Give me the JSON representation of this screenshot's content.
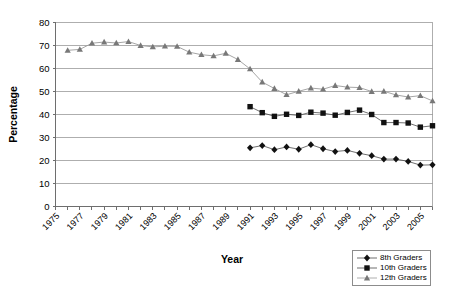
{
  "chart_data": {
    "type": "line",
    "title": "",
    "xlabel": "Year",
    "ylabel": "Percentage",
    "xlim": [
      1975,
      2006
    ],
    "ylim": [
      0,
      80
    ],
    "ytick_step": 10,
    "grid": true,
    "legend_position": "bottom-right",
    "yticks": [
      0,
      10,
      20,
      30,
      40,
      50,
      60,
      70,
      80
    ],
    "xticks": [
      1975,
      1976,
      1977,
      1978,
      1979,
      1980,
      1981,
      1982,
      1983,
      1984,
      1985,
      1986,
      1987,
      1988,
      1989,
      1990,
      1991,
      1992,
      1993,
      1994,
      1995,
      1996,
      1997,
      1998,
      1999,
      2000,
      2001,
      2002,
      2003,
      2004,
      2005,
      2006
    ],
    "xtick_labels": [
      "1975",
      "",
      "1977",
      "",
      "1979",
      "",
      "1981",
      "",
      "1983",
      "",
      "1985",
      "",
      "1987",
      "",
      "1989",
      "",
      "1991",
      "",
      "1993",
      "",
      "1995",
      "",
      "1997",
      "",
      "1999",
      "",
      "2001",
      "",
      "2003",
      "",
      "2005",
      ""
    ],
    "series": [
      {
        "name": "8th Graders",
        "marker": "diamond",
        "color": "#111111",
        "x": [
          1991,
          1992,
          1993,
          1994,
          1995,
          1996,
          1997,
          1998,
          1999,
          2000,
          2001,
          2002,
          2003,
          2004,
          2005,
          2006
        ],
        "values": [
          25.5,
          26.5,
          24.7,
          25.9,
          24.9,
          26.9,
          25.1,
          23.9,
          24.4,
          23.1,
          22.1,
          20.6,
          20.6,
          19.6,
          18.0,
          18.1
        ]
      },
      {
        "name": "10th Graders",
        "marker": "square",
        "color": "#111111",
        "x": [
          1991,
          1992,
          1993,
          1994,
          1995,
          1996,
          1997,
          1998,
          1999,
          2000,
          2001,
          2002,
          2003,
          2004,
          2005,
          2006
        ],
        "values": [
          43.4,
          40.8,
          39.2,
          40.1,
          39.6,
          41.0,
          40.6,
          39.7,
          40.9,
          41.9,
          40.0,
          36.5,
          36.5,
          36.3,
          34.5,
          35.1
        ]
      },
      {
        "name": "12th Graders",
        "marker": "triangle",
        "color": "#787878",
        "x": [
          1976,
          1977,
          1978,
          1979,
          1980,
          1981,
          1982,
          1983,
          1984,
          1985,
          1986,
          1987,
          1988,
          1989,
          1990,
          1991,
          1992,
          1993,
          1994,
          1995,
          1996,
          1997,
          1998,
          1999,
          2000,
          2001,
          2002,
          2003,
          2004,
          2005,
          2006
        ],
        "values": [
          67.9,
          68.3,
          71.0,
          71.5,
          71.1,
          71.7,
          70.0,
          69.4,
          69.7,
          69.6,
          67.1,
          66.0,
          65.5,
          66.6,
          63.9,
          59.8,
          54.1,
          51.3,
          48.6,
          50.1,
          51.5,
          51.0,
          52.6,
          51.9,
          51.7,
          50.0,
          50.1,
          48.5,
          47.6,
          48.2,
          45.9
        ]
      }
    ],
    "legend": [
      {
        "label": "8th Graders",
        "marker": "diamond",
        "color": "#111111"
      },
      {
        "label": "10th Graders",
        "marker": "square",
        "color": "#111111"
      },
      {
        "label": "12th Graders",
        "marker": "triangle",
        "color": "#787878"
      }
    ]
  }
}
